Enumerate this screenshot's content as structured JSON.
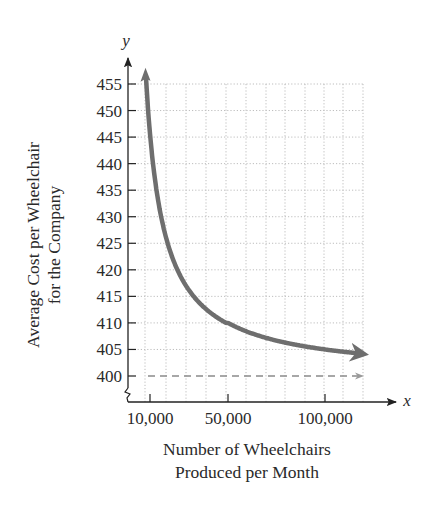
{
  "chart_data": {
    "type": "line",
    "title": "",
    "xlabel": "Number of Wheelchairs Produced per Month",
    "xlabel_lines": [
      "Number of Wheelchairs",
      "Produced per Month"
    ],
    "ylabel": "Average Cost per Wheelchair for the Company",
    "ylabel_lines": [
      "Average Cost per Wheelchair",
      "for the Company"
    ],
    "x_axis_var": "x",
    "y_axis_var": "y",
    "x_ticks": [
      10000,
      50000,
      100000
    ],
    "x_tick_labels": [
      "10,000",
      "50,000",
      "100,000"
    ],
    "y_ticks": [
      400,
      405,
      410,
      415,
      420,
      425,
      430,
      435,
      440,
      445,
      450,
      455
    ],
    "y_tick_labels": [
      "400",
      "405",
      "410",
      "415",
      "420",
      "425",
      "430",
      "435",
      "440",
      "445",
      "450",
      "455"
    ],
    "xlim": [
      0,
      120000
    ],
    "ylim": [
      400,
      455
    ],
    "y_axis_break": true,
    "grid": true,
    "legend": null,
    "series": [
      {
        "name": "Average cost",
        "style": "solid",
        "color": "#6e6e6e",
        "x": [
          9000,
          10000,
          12000,
          15000,
          20000,
          25000,
          30000,
          40000,
          50000,
          60000,
          70000,
          80000,
          90000,
          100000,
          110000,
          118000
        ],
        "values": [
          455.6,
          450.0,
          441.7,
          433.3,
          425.0,
          420.0,
          416.7,
          412.5,
          410.0,
          408.3,
          407.1,
          406.3,
          405.6,
          405.0,
          404.5,
          404.2
        ]
      },
      {
        "name": "Horizontal asymptote y = 400",
        "style": "dashed",
        "color": "#8a8a8a",
        "x": [
          10000,
          118000
        ],
        "values": [
          400,
          400
        ]
      }
    ]
  }
}
